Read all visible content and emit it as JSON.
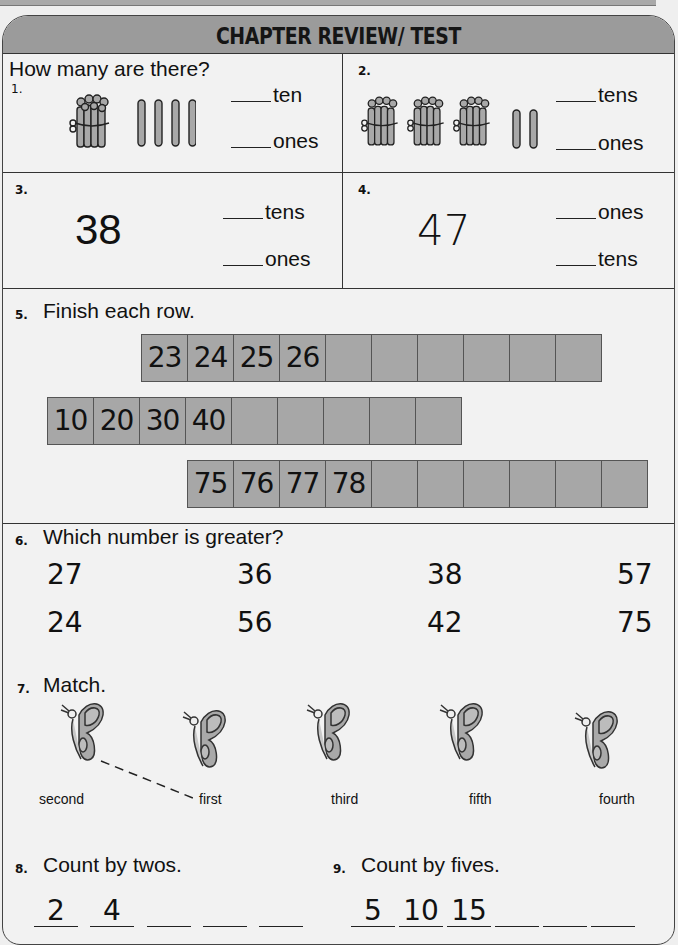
{
  "header": {
    "title": "CHAPTER REVIEW/ TEST"
  },
  "section_ab": {
    "prompt": "How many are there?",
    "q1": {
      "number": "1.",
      "bundles": 1,
      "sticks": 4,
      "labels": [
        "ten",
        "ones"
      ]
    },
    "q2": {
      "number": "2.",
      "bundles": 3,
      "sticks": 2,
      "labels": [
        "tens",
        "ones"
      ]
    },
    "q3": {
      "number": "3.",
      "value": "38",
      "labels": [
        "tens",
        "ones"
      ]
    },
    "q4": {
      "number": "4.",
      "value": "47",
      "labels": [
        "ones",
        "tens"
      ]
    }
  },
  "q5": {
    "number": "5.",
    "prompt": "Finish each row.",
    "rows": [
      {
        "cells": [
          "23",
          "24",
          "25",
          "26",
          "",
          "",
          "",
          "",
          "",
          ""
        ]
      },
      {
        "cells": [
          "10",
          "20",
          "30",
          "40",
          "",
          "",
          "",
          "",
          ""
        ]
      },
      {
        "cells": [
          "75",
          "76",
          "77",
          "78",
          "",
          "",
          "",
          "",
          "",
          ""
        ]
      }
    ]
  },
  "q6": {
    "number": "6.",
    "prompt": "Which number is greater?",
    "pairs": [
      {
        "top": "27",
        "bottom": "24"
      },
      {
        "top": "36",
        "bottom": "56"
      },
      {
        "top": "38",
        "bottom": "42"
      },
      {
        "top": "57",
        "bottom": "75"
      }
    ]
  },
  "q7": {
    "number": "7.",
    "prompt": "Match.",
    "butterflies": 5,
    "ordinals": [
      "second",
      "first",
      "third",
      "fifth",
      "fourth"
    ],
    "example_match": {
      "from_butterfly": 1,
      "to_label": "first"
    }
  },
  "q8": {
    "number": "8.",
    "prompt": "Count by twos.",
    "slots": [
      "2",
      "4",
      "",
      "",
      ""
    ]
  },
  "q9": {
    "number": "9.",
    "prompt": "Count by fives.",
    "slots": [
      "5",
      "10",
      "15",
      "",
      "",
      ""
    ]
  },
  "colors": {
    "header_bg": "#9b9b9b",
    "cell_bg": "#a7a7a7",
    "page_bg": "#f2f2f2",
    "ink": "#111111"
  }
}
